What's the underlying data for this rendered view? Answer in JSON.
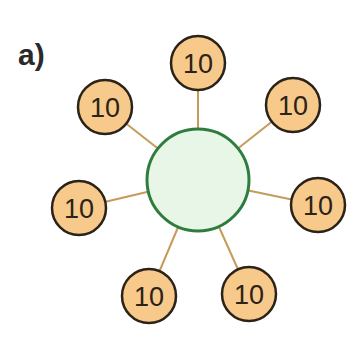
{
  "label": "a)",
  "center": {
    "x": 198,
    "y": 180,
    "r": 51,
    "fill": "#e8f6e8",
    "stroke": "#2e7d3e"
  },
  "nodes": [
    {
      "value": "10",
      "x": 198,
      "y": 63
    },
    {
      "value": "10",
      "x": 293,
      "y": 105
    },
    {
      "value": "10",
      "x": 318,
      "y": 205
    },
    {
      "value": "10",
      "x": 249,
      "y": 294
    },
    {
      "value": "10",
      "x": 149,
      "y": 296
    },
    {
      "value": "10",
      "x": 79,
      "y": 208
    },
    {
      "value": "10",
      "x": 105,
      "y": 107
    }
  ],
  "node_style": {
    "r": 27,
    "fill": "#f7c98a",
    "stroke": "#2b2218"
  },
  "edge_color": "#c79a5a"
}
